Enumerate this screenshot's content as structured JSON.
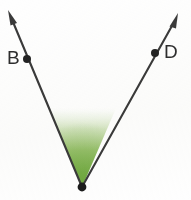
{
  "figure": {
    "kind": "geometry-angle-diagram",
    "width": 191,
    "height": 200,
    "background_color": "#fefefe",
    "line_color": "#3a3a3a",
    "line_width": 2,
    "vertex": {
      "x": 82,
      "y": 187,
      "dot_radius": 4,
      "label": ""
    },
    "shading": {
      "fill_name": "angle-interior-shading",
      "color_strong": "#7ab04a",
      "color_mid": "#a8c97e",
      "color_fade": "#ffffff",
      "top_y": 106
    },
    "rays": [
      {
        "name": "ray-vertex-to-B",
        "label": "B",
        "label_x": 7,
        "label_y": 48,
        "point_dot": {
          "x": 27,
          "y": 59,
          "radius": 4
        },
        "from": {
          "x": 82,
          "y": 187
        },
        "to": {
          "x": 8,
          "y": 10
        },
        "arrowhead": true
      },
      {
        "name": "ray-vertex-to-D",
        "label": "D",
        "label_x": 164,
        "label_y": 42,
        "point_dot": {
          "x": 155,
          "y": 53,
          "radius": 4
        },
        "from": {
          "x": 82,
          "y": 187
        },
        "to": {
          "x": 178,
          "y": 13
        },
        "arrowhead": true
      }
    ]
  },
  "labels": {
    "left_point": "B",
    "right_point": "D"
  }
}
